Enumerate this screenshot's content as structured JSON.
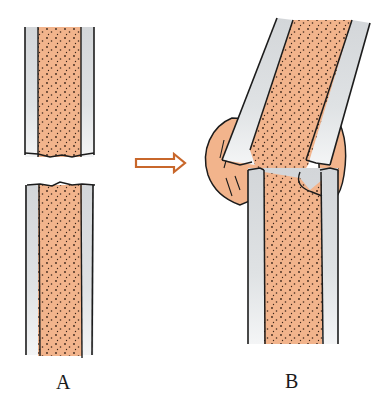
{
  "figure": {
    "panels": [
      {
        "id": "A",
        "label": "A",
        "content": "fractured bone shaft, two separated fragments"
      },
      {
        "id": "B",
        "label": "B",
        "content": "misaligned bone ends joined by callus"
      }
    ],
    "arrow": {
      "direction": "right",
      "style": "outlined"
    }
  },
  "colors": {
    "marrow": "#f2b48c",
    "cortex": "#d9dcde",
    "cortex_light": "#f2f3f4",
    "outline": "#1c1c1c",
    "arrow": "#c8672b",
    "dots": "#3a2418",
    "background": "#ffffff"
  }
}
